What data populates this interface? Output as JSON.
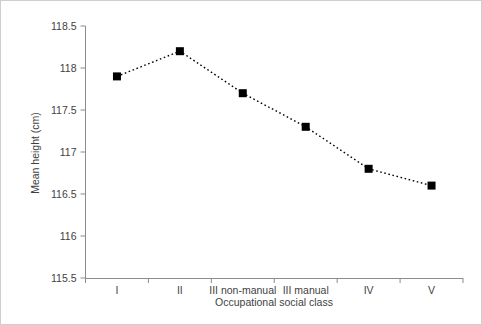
{
  "chart_data": {
    "type": "line",
    "title": "",
    "xlabel": "Occupational social class",
    "ylabel": "Mean height (cm)",
    "categories": [
      "I",
      "II",
      "III non-manual",
      "III manual",
      "IV",
      "V"
    ],
    "values": [
      117.9,
      118.2,
      117.7,
      117.3,
      116.8,
      116.6
    ],
    "series": [
      {
        "name": "Mean height",
        "values": [
          117.9,
          118.2,
          117.7,
          117.3,
          116.8,
          116.6
        ]
      }
    ],
    "ylim": [
      115.5,
      118.5
    ],
    "yticks": [
      115.5,
      116,
      116.5,
      117,
      117.5,
      118,
      118.5
    ],
    "ytick_labels": [
      "115.5",
      "116",
      "116.5",
      "117",
      "117.5",
      "118",
      "118.5"
    ],
    "grid": false,
    "legend": false,
    "legend_position": "none",
    "marker": "square",
    "marker_color": "#000000",
    "line_style": "dotted",
    "line_color": "#000000",
    "axis_color": "#8c8c8c",
    "frame_color": "#cfcfcf",
    "text_color": "#3f3f3f",
    "background": "#ffffff"
  },
  "axis": {
    "y_title": "Mean height (cm)",
    "x_title": "Occupational social class",
    "y_ticks": [
      {
        "label": "118.5",
        "value": 118.5
      },
      {
        "label": "118",
        "value": 118
      },
      {
        "label": "117.5",
        "value": 117.5
      },
      {
        "label": "117",
        "value": 117
      },
      {
        "label": "116.5",
        "value": 116.5
      },
      {
        "label": "116",
        "value": 116
      },
      {
        "label": "115.5",
        "value": 115.5
      }
    ],
    "x_categories": [
      {
        "label": "I",
        "value": 117.9
      },
      {
        "label": "II",
        "value": 118.2
      },
      {
        "label": "III non-manual",
        "value": 117.7
      },
      {
        "label": "III manual",
        "value": 117.3
      },
      {
        "label": "IV",
        "value": 116.8
      },
      {
        "label": "V",
        "value": 116.6
      }
    ]
  }
}
